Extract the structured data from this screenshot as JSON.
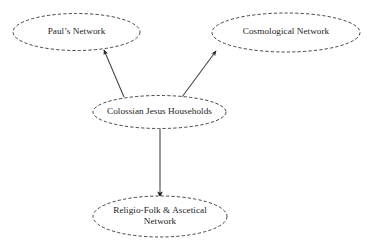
{
  "diagram": {
    "type": "node-link-diagram",
    "title": "",
    "background_color": "#ffffff",
    "node_stroke_color": "#3a3a3a",
    "node_fill_color": "#ffffff",
    "node_stroke_style": "dashed",
    "edge_color": "#404040",
    "text_color": "#1c1c1c",
    "nodes": [
      {
        "id": "pauls-network",
        "label": "Paul’s Network",
        "shape": "ellipse",
        "cx": 76.5,
        "cy": 32,
        "rx": 63.5,
        "ry": 18.5
      },
      {
        "id": "cosmological-network",
        "label": "Cosmological Network",
        "shape": "ellipse",
        "cx": 286,
        "cy": 32.5,
        "rx": 74,
        "ry": 19.5
      },
      {
        "id": "colossian-jesus-households",
        "label": "Colossian Jesus Households",
        "shape": "ellipse",
        "cx": 159.5,
        "cy": 112,
        "rx": 66.5,
        "ry": 16.5
      },
      {
        "id": "religio-folk-ascetical-network",
        "label": "Religio-Folk & Ascetical\nNetwork",
        "shape": "ellipse",
        "cx": 160,
        "cy": 216.5,
        "rx": 67,
        "ry": 20.5
      }
    ],
    "edges": [
      {
        "id": "edge-households-to-pauls",
        "from": "colossian-jesus-households",
        "to": "pauls-network",
        "arrowhead": "filled-triangle",
        "x1": 124,
        "y1": 97,
        "x2": 104,
        "y2": 50
      },
      {
        "id": "edge-households-to-cosmological",
        "from": "colossian-jesus-households",
        "to": "cosmological-network",
        "arrowhead": "filled-triangle",
        "x1": 182,
        "y1": 97,
        "x2": 216,
        "y2": 51
      },
      {
        "id": "edge-households-to-religio-folk",
        "from": "colossian-jesus-households",
        "to": "religio-folk-ascetical-network",
        "arrowhead": "filled-triangle",
        "x1": 160,
        "y1": 129,
        "x2": 160,
        "y2": 197
      }
    ]
  }
}
